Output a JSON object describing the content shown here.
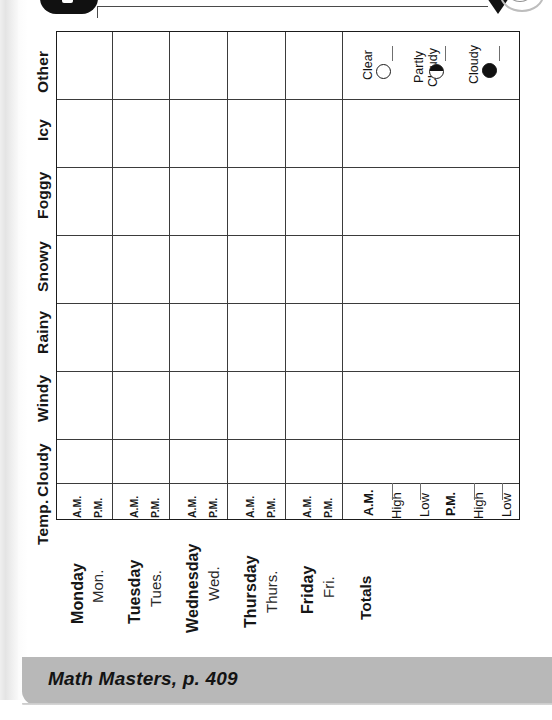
{
  "document": {
    "orientation": "rotated-90",
    "worksheet_title": "Weather Report",
    "footer_citation": "Math Masters, p. 409"
  },
  "table": {
    "row_categories": [
      {
        "id": "temp",
        "label": "Temp."
      },
      {
        "id": "cloudy",
        "label": "Cloudy"
      },
      {
        "id": "windy",
        "label": "Windy"
      },
      {
        "id": "rainy",
        "label": "Rainy"
      },
      {
        "id": "snowy",
        "label": "Snowy"
      },
      {
        "id": "foggy",
        "label": "Foggy"
      },
      {
        "id": "icy",
        "label": "Icy"
      },
      {
        "id": "other",
        "label": "Other"
      }
    ],
    "day_columns": [
      {
        "full": "Monday",
        "abbr": "Mon.",
        "am": "A.M.",
        "pm": "P.M."
      },
      {
        "full": "Tuesday",
        "abbr": "Tues.",
        "am": "A.M.",
        "pm": "P.M."
      },
      {
        "full": "Wednesday",
        "abbr": "Wed.",
        "am": "A.M.",
        "pm": "P.M."
      },
      {
        "full": "Thursday",
        "abbr": "Thurs.",
        "am": "A.M.",
        "pm": "P.M."
      },
      {
        "full": "Friday",
        "abbr": "Fri.",
        "am": "A.M.",
        "pm": "P.M."
      }
    ],
    "totals_column": {
      "label": "Totals",
      "entries": [
        {
          "id": "am",
          "text": "A.M.",
          "bold": true
        },
        {
          "id": "am-high",
          "text": "High",
          "bold": false
        },
        {
          "id": "am-low",
          "text": "Low",
          "bold": false
        },
        {
          "id": "pm",
          "text": "P.M.",
          "bold": true
        },
        {
          "id": "pm-high",
          "text": "High",
          "bold": false
        },
        {
          "id": "pm-low",
          "text": "Low",
          "bold": false
        }
      ]
    },
    "legend": [
      {
        "id": "clear",
        "line1": "Clear",
        "line2": "",
        "symbol": "open-circle"
      },
      {
        "id": "partly-cloudy",
        "line1": "Partly",
        "line2": "Cloudy",
        "symbol": "half-filled-circle"
      },
      {
        "id": "cloudy",
        "line1": "Cloudy",
        "line2": "",
        "symbol": "filled-circle"
      }
    ]
  },
  "colors": {
    "ink": "#161616",
    "grid_outer": "#1b1b1b",
    "grid_inner": "#6a6a6a",
    "footer_band": "#b8b8b8",
    "page_edge": "#e4e4e4"
  }
}
